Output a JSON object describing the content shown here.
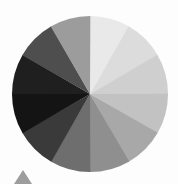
{
  "page": {
    "title": "Grayscale Color Wheel",
    "background_color": "#fdfdfd",
    "width": 178,
    "height": 184
  },
  "wheel": {
    "name": "grayscale-color-wheel",
    "center_x": 90,
    "center_y": 94,
    "radius": 78,
    "segment_count": 12,
    "segment_angle_degrees": 30,
    "start_angle_degrees": -90,
    "direction": "clockwise"
  },
  "marker": {
    "name": "triangle-marker",
    "shape": "triangle-up",
    "color": "#9d9d9d",
    "center_x": 23,
    "base_y": 184,
    "apex_y": 170,
    "half_width": 9
  },
  "chart_data": {
    "type": "pie",
    "title": "Grayscale Color Wheel",
    "subtitle": "",
    "xlabel": "",
    "ylabel": "",
    "legend_position": "none",
    "grid": false,
    "equal_slices": true,
    "categories": [
      "12 o'clock",
      "1 o'clock",
      "2 o'clock",
      "3 o'clock",
      "4 o'clock",
      "5 o'clock",
      "6 o'clock",
      "7 o'clock",
      "8 o'clock",
      "9 o'clock",
      "10 o'clock",
      "11 o'clock"
    ],
    "values": [
      8.333,
      8.333,
      8.333,
      8.333,
      8.333,
      8.333,
      8.333,
      8.333,
      8.333,
      8.333,
      8.333,
      8.333
    ],
    "colors": [
      "#e9e9e9",
      "#dcdcdc",
      "#cfcfcf",
      "#c2c2c2",
      "#a8a8a8",
      "#8f8f8f",
      "#6e6e6e",
      "#3a3a3a",
      "#141414",
      "#1f1f1f",
      "#4e4e4e",
      "#9c9c9c"
    ],
    "slices": [
      {
        "label": "12 o'clock",
        "start_deg": -90,
        "end_deg": -60,
        "color": "#e9e9e9",
        "value": 8.333
      },
      {
        "label": "1 o'clock",
        "start_deg": -60,
        "end_deg": -30,
        "color": "#dcdcdc",
        "value": 8.333
      },
      {
        "label": "2 o'clock",
        "start_deg": -30,
        "end_deg": 0,
        "color": "#cfcfcf",
        "value": 8.333
      },
      {
        "label": "3 o'clock",
        "start_deg": 0,
        "end_deg": 30,
        "color": "#c2c2c2",
        "value": 8.333
      },
      {
        "label": "4 o'clock",
        "start_deg": 30,
        "end_deg": 60,
        "color": "#a8a8a8",
        "value": 8.333
      },
      {
        "label": "5 o'clock",
        "start_deg": 60,
        "end_deg": 90,
        "color": "#8f8f8f",
        "value": 8.333
      },
      {
        "label": "6 o'clock",
        "start_deg": 90,
        "end_deg": 120,
        "color": "#6e6e6e",
        "value": 8.333
      },
      {
        "label": "7 o'clock",
        "start_deg": 120,
        "end_deg": 150,
        "color": "#3a3a3a",
        "value": 8.333
      },
      {
        "label": "8 o'clock",
        "start_deg": 150,
        "end_deg": 180,
        "color": "#141414",
        "value": 8.333
      },
      {
        "label": "9 o'clock",
        "start_deg": 180,
        "end_deg": 210,
        "color": "#1f1f1f",
        "value": 8.333
      },
      {
        "label": "10 o'clock",
        "start_deg": 210,
        "end_deg": 240,
        "color": "#4e4e4e",
        "value": 8.333
      },
      {
        "label": "11 o'clock",
        "start_deg": 240,
        "end_deg": 270,
        "color": "#9c9c9c",
        "value": 8.333
      }
    ]
  }
}
